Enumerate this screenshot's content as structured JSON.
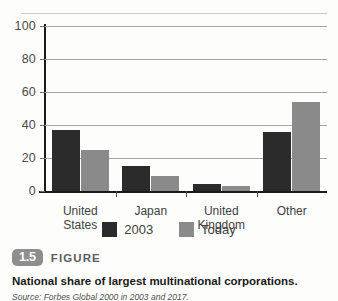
{
  "chart_data": {
    "type": "bar",
    "title": "",
    "xlabel": "",
    "ylabel": "",
    "ylim": [
      0,
      100
    ],
    "yticks": [
      0,
      20,
      40,
      60,
      80,
      100
    ],
    "grid": true,
    "legend_position": "bottom",
    "categories": [
      "United States",
      "Japan",
      "United Kingdom",
      "Other"
    ],
    "series": [
      {
        "name": "2003",
        "color": "#2b2b2b",
        "values": [
          37,
          15,
          4,
          35.5
        ]
      },
      {
        "name": "Today",
        "color": "#8a8a8a",
        "values": [
          25,
          9,
          3,
          54
        ]
      }
    ]
  },
  "figure": {
    "number": "1.5",
    "word": "FIGURE",
    "caption": "National share of largest multinational corporations.",
    "source": "Source: Forbes Global 2000 in 2003 and 2017."
  },
  "colors": {
    "series_2003": "#2b2b2b",
    "series_today": "#8a8a8a",
    "badge": "#8e8e8e",
    "gridline": "#a6a6a6",
    "axis": "#1a1a1a"
  }
}
